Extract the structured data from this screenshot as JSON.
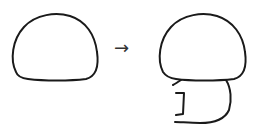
{
  "diagram": {
    "arrow": "→",
    "steps": [
      {
        "label": "",
        "shape": "dome"
      },
      {
        "label": "",
        "shape": "dome-with-body"
      }
    ],
    "colors": {
      "stroke": "#1a1a1a",
      "background": "#ffffff"
    }
  }
}
